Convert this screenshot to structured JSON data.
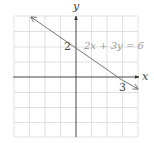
{
  "graph": {
    "axis_labels": {
      "x": "x",
      "y": "y"
    },
    "equation_label": "2x + 3y = 6",
    "intercepts": {
      "y_intercept_label": "2",
      "x_intercept_label": "3"
    },
    "grid": {
      "xmin": -4,
      "xmax": 4,
      "ymin": -4,
      "ymax": 4,
      "step": 1
    },
    "line": {
      "slope": "-2/3",
      "y_intercept": 2,
      "x_intercept": 3
    },
    "colors": {
      "grid": "#d9d9d9",
      "axis": "#333333",
      "line": "#777777",
      "equation_text": "#9a9a9a"
    }
  }
}
